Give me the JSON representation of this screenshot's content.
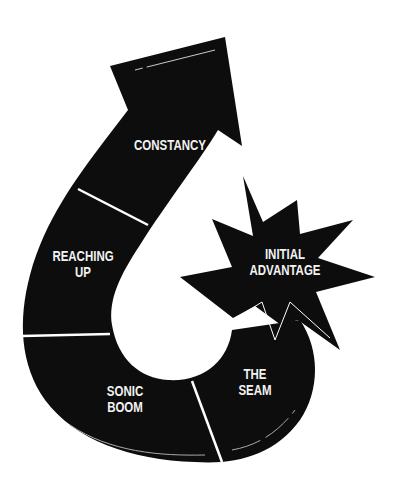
{
  "diagram": {
    "type": "curved-arrow-stages",
    "colors": {
      "shape": "#0d0d0d",
      "text": "#f2f2f2",
      "background": "#ffffff"
    },
    "stages": [
      {
        "line1": "CONSTANCY",
        "line2": ""
      },
      {
        "line1": "REACHING",
        "line2": "UP"
      },
      {
        "line1": "SONIC",
        "line2": "BOOM"
      },
      {
        "line1": "THE",
        "line2": "SEAM"
      }
    ],
    "starburst": {
      "line1": "INITIAL",
      "line2": "ADVANTAGE"
    }
  }
}
